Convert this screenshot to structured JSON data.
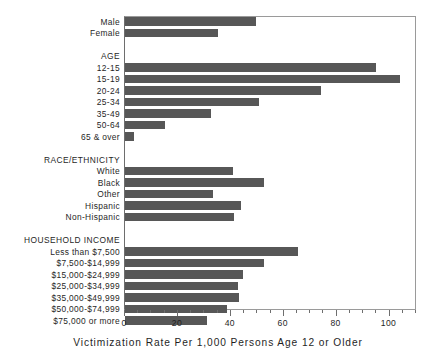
{
  "chart_data": {
    "type": "bar",
    "orientation": "horizontal",
    "title": "",
    "xlabel": "Victimization Rate Per 1,000 Persons Age 12 or Older",
    "ylabel": "",
    "xlim": [
      0,
      110
    ],
    "xticks": [
      0,
      20,
      40,
      60,
      80,
      100
    ],
    "xtick_labels": [
      "0",
      "20",
      "40",
      "60",
      "80",
      "100"
    ],
    "minor_tick_step": 5,
    "grid": false,
    "legend": false,
    "bar_color": "#575757",
    "categories": [
      "Male",
      "Female",
      "",
      "AGE",
      "12-15",
      "15-19",
      "20-24",
      "25-34",
      "35-49",
      "50-64",
      "65 & over",
      "",
      "RACE/ETHNICITY",
      "White",
      "Black",
      "Other",
      "Hispanic",
      "Non-Hispanic",
      "",
      "HOUSEHOLD INCOME",
      "Less than $7,500",
      "$7,500-$14,999",
      "$15,000-$24,999",
      "$25,000-$34,999",
      "$35,000-$49,999",
      "$50,000-$74,999",
      "$75,000 or more"
    ],
    "values": [
      49.6,
      35.3,
      null,
      null,
      95.0,
      103.8,
      74.0,
      50.8,
      32.6,
      15.2,
      3.4,
      null,
      null,
      41.0,
      52.7,
      33.4,
      44.0,
      41.3,
      null,
      null,
      65.5,
      52.6,
      44.7,
      42.9,
      43.2,
      38.6,
      31.0
    ]
  },
  "rows": [
    {
      "label": "Male",
      "value": 49.6,
      "group": false
    },
    {
      "label": "Female",
      "value": 35.3,
      "group": false
    },
    {
      "label": "",
      "value": null,
      "group": false
    },
    {
      "label": "AGE",
      "value": null,
      "group": true
    },
    {
      "label": "12-15",
      "value": 95.0,
      "group": false
    },
    {
      "label": "15-19",
      "value": 103.8,
      "group": false
    },
    {
      "label": "20-24",
      "value": 74.0,
      "group": false
    },
    {
      "label": "25-34",
      "value": 50.8,
      "group": false
    },
    {
      "label": "35-49",
      "value": 32.6,
      "group": false
    },
    {
      "label": "50-64",
      "value": 15.2,
      "group": false
    },
    {
      "label": "65 & over",
      "value": 3.4,
      "group": false
    },
    {
      "label": "",
      "value": null,
      "group": false
    },
    {
      "label": "RACE/ETHNICITY",
      "value": null,
      "group": true
    },
    {
      "label": "White",
      "value": 41.0,
      "group": false
    },
    {
      "label": "Black",
      "value": 52.7,
      "group": false
    },
    {
      "label": "Other",
      "value": 33.4,
      "group": false
    },
    {
      "label": "Hispanic",
      "value": 44.0,
      "group": false
    },
    {
      "label": "Non-Hispanic",
      "value": 41.3,
      "group": false
    },
    {
      "label": "",
      "value": null,
      "group": false
    },
    {
      "label": "HOUSEHOLD INCOME",
      "value": null,
      "group": true
    },
    {
      "label": "Less than $7,500",
      "value": 65.5,
      "group": false
    },
    {
      "label": "$7,500-$14,999",
      "value": 52.6,
      "group": false
    },
    {
      "label": "$15,000-$24,999",
      "value": 44.7,
      "group": false
    },
    {
      "label": "$25,000-$34,999",
      "value": 42.9,
      "group": false
    },
    {
      "label": "$35,000-$49,999",
      "value": 43.2,
      "group": false
    },
    {
      "label": "$50,000-$74,999",
      "value": 38.6,
      "group": false
    },
    {
      "label": "$75,000 or more",
      "value": 31.0,
      "group": false
    }
  ]
}
